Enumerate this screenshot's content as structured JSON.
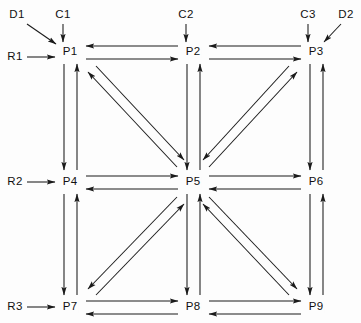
{
  "diagram": {
    "type": "node-link-grid",
    "title": "",
    "canvas": {
      "width": 361,
      "height": 323
    },
    "style": {
      "line_color": "#1a1a1a",
      "text_color": "#111111",
      "background_color": "#fdfdfd",
      "line_width": 1,
      "arrow_style": "solid-filled-head"
    },
    "nodes": [
      {
        "id": "P1",
        "label": "P1",
        "x": 70,
        "y": 52,
        "row": 0,
        "col": 0
      },
      {
        "id": "P2",
        "label": "P2",
        "x": 193,
        "y": 52,
        "row": 0,
        "col": 1
      },
      {
        "id": "P3",
        "label": "P3",
        "x": 316,
        "y": 52,
        "row": 0,
        "col": 2
      },
      {
        "id": "P4",
        "label": "P4",
        "x": 70,
        "y": 182,
        "row": 1,
        "col": 0
      },
      {
        "id": "P5",
        "label": "P5",
        "x": 193,
        "y": 182,
        "row": 1,
        "col": 1
      },
      {
        "id": "P6",
        "label": "P6",
        "x": 316,
        "y": 182,
        "row": 1,
        "col": 2
      },
      {
        "id": "P7",
        "label": "P7",
        "x": 70,
        "y": 307,
        "row": 2,
        "col": 0
      },
      {
        "id": "P8",
        "label": "P8",
        "x": 193,
        "y": 307,
        "row": 2,
        "col": 1
      },
      {
        "id": "P9",
        "label": "P9",
        "x": 316,
        "y": 307,
        "row": 2,
        "col": 2
      }
    ],
    "external_inputs": [
      {
        "id": "C1",
        "label": "C1",
        "x": 63,
        "y": 15,
        "target": "P1",
        "direction": "vertical-down"
      },
      {
        "id": "C2",
        "label": "C2",
        "x": 186,
        "y": 15,
        "target": "P2",
        "direction": "vertical-down"
      },
      {
        "id": "C3",
        "label": "C3",
        "x": 308,
        "y": 15,
        "target": "P3",
        "direction": "vertical-down"
      },
      {
        "id": "D1",
        "label": "D1",
        "x": 17,
        "y": 15,
        "target": "P1",
        "direction": "diagonal-down-right"
      },
      {
        "id": "D2",
        "label": "D2",
        "x": 346,
        "y": 15,
        "target": "P3",
        "direction": "diagonal-down-left"
      },
      {
        "id": "R1",
        "label": "R1",
        "x": 15,
        "y": 57,
        "target": "P1",
        "direction": "horizontal-right"
      },
      {
        "id": "R2",
        "label": "R2",
        "x": 15,
        "y": 182,
        "target": "P4",
        "direction": "horizontal-right"
      },
      {
        "id": "R3",
        "label": "R3",
        "x": 15,
        "y": 307,
        "target": "P7",
        "direction": "horizontal-right"
      }
    ],
    "edges": [
      {
        "from": "P1",
        "to": "P2",
        "bidirectional": true,
        "orientation": "horizontal"
      },
      {
        "from": "P2",
        "to": "P3",
        "bidirectional": true,
        "orientation": "horizontal"
      },
      {
        "from": "P4",
        "to": "P5",
        "bidirectional": true,
        "orientation": "horizontal"
      },
      {
        "from": "P5",
        "to": "P6",
        "bidirectional": true,
        "orientation": "horizontal"
      },
      {
        "from": "P7",
        "to": "P8",
        "bidirectional": true,
        "orientation": "horizontal"
      },
      {
        "from": "P8",
        "to": "P9",
        "bidirectional": true,
        "orientation": "horizontal"
      },
      {
        "from": "P1",
        "to": "P4",
        "bidirectional": true,
        "orientation": "vertical"
      },
      {
        "from": "P4",
        "to": "P7",
        "bidirectional": true,
        "orientation": "vertical"
      },
      {
        "from": "P2",
        "to": "P5",
        "bidirectional": true,
        "orientation": "vertical"
      },
      {
        "from": "P5",
        "to": "P8",
        "bidirectional": true,
        "orientation": "vertical"
      },
      {
        "from": "P3",
        "to": "P6",
        "bidirectional": true,
        "orientation": "vertical"
      },
      {
        "from": "P6",
        "to": "P9",
        "bidirectional": true,
        "orientation": "vertical"
      },
      {
        "from": "P1",
        "to": "P5",
        "bidirectional": true,
        "orientation": "diagonal"
      },
      {
        "from": "P3",
        "to": "P5",
        "bidirectional": true,
        "orientation": "diagonal"
      },
      {
        "from": "P7",
        "to": "P5",
        "bidirectional": true,
        "orientation": "diagonal"
      },
      {
        "from": "P9",
        "to": "P5",
        "bidirectional": true,
        "orientation": "diagonal"
      }
    ],
    "counts": {
      "nodes": 9,
      "edges": 16,
      "external_inputs": 8
    }
  }
}
